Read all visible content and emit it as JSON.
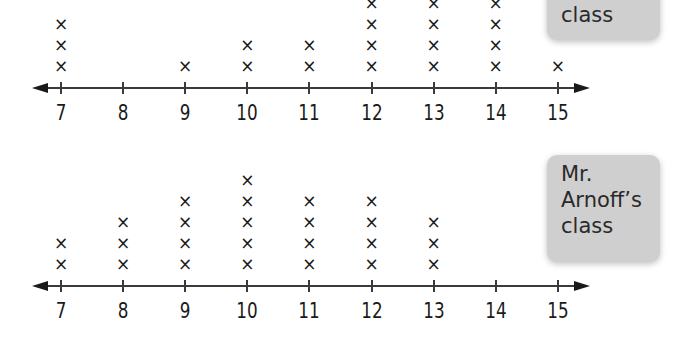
{
  "chart_data": [
    {
      "type": "dot_plot",
      "title": "",
      "label": "class",
      "label_note": "label text partially cropped at top; only 'class' visible",
      "xlabel": "",
      "ylabel": "",
      "categories": [
        7,
        8,
        9,
        10,
        11,
        12,
        13,
        14,
        15
      ],
      "values": [
        3,
        0,
        1,
        2,
        2,
        4,
        4,
        4,
        1
      ],
      "xlim": [
        7,
        15
      ],
      "grid": false,
      "mark": "x"
    },
    {
      "type": "dot_plot",
      "title": "",
      "label": "Mr. Arnoff's class",
      "xlabel": "",
      "ylabel": "",
      "categories": [
        7,
        8,
        9,
        10,
        11,
        12,
        13,
        14,
        15
      ],
      "values": [
        2,
        3,
        4,
        5,
        4,
        4,
        3,
        0,
        0
      ],
      "xlim": [
        7,
        15
      ],
      "grid": false,
      "mark": "x"
    }
  ],
  "plots": [
    {
      "label_lines": [
        "class"
      ],
      "ticks": [
        "7",
        "8",
        "9",
        "10",
        "11",
        "12",
        "13",
        "14",
        "15"
      ]
    },
    {
      "label_lines": [
        "Mr.",
        "Arnoff’s",
        "class"
      ],
      "ticks": [
        "7",
        "8",
        "9",
        "10",
        "11",
        "12",
        "13",
        "14",
        "15"
      ]
    }
  ],
  "mark_glyph": "×",
  "colors": {
    "ink": "#1a1a1a",
    "label_box": "#cfcfcf",
    "background": "#ffffff"
  }
}
